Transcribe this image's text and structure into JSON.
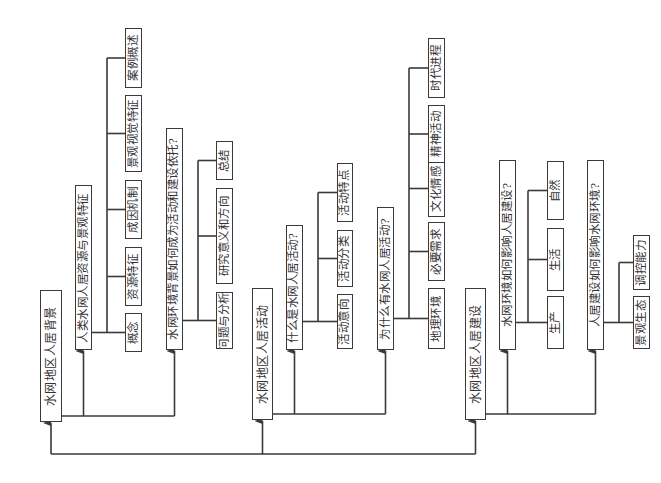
{
  "diagram": {
    "type": "hierarchical-tree",
    "orientation": "rotated-90-ccw",
    "line_color": "#3a3a3a",
    "sections": [
      {
        "id": "s1",
        "root": {
          "label": "水网地区人居背景",
          "box": [
            40,
            290,
            22,
            132
          ]
        },
        "branches": [
          {
            "label": "人类水网人居资源与景观特征",
            "box": [
              75,
              185,
              17,
              165
            ],
            "bracket_x": 107,
            "children": [
              {
                "label": "概念",
                "box": [
                  125,
                  313,
                  17,
                  39
                ]
              },
              {
                "label": "资源特征",
                "box": [
                  125,
                  247,
                  17,
                  59
                ]
              },
              {
                "label": "成因机制",
                "box": [
                  125,
                  180,
                  17,
                  59
                ]
              },
              {
                "label": "景观视觉特征",
                "box": [
                  125,
                  95,
                  17,
                  77
                ]
              },
              {
                "label": "案例概述",
                "box": [
                  125,
                  28,
                  17,
                  60
                ]
              }
            ]
          },
          {
            "label": "水网环境背景如何成为活动和建设依托?",
            "box": [
              166,
              128,
              17,
              222
            ],
            "bracket_x": 198,
            "children": [
              {
                "label": "问题与分析",
                "box": [
                  216,
                  292,
                  17,
                  57
                ]
              },
              {
                "label": "研究意义和方向",
                "box": [
                  216,
                  188,
                  17,
                  96
                ]
              },
              {
                "label": "总结",
                "box": [
                  216,
                  141,
                  17,
                  39
                ]
              }
            ]
          }
        ]
      },
      {
        "id": "s2",
        "root": {
          "label": "水网地区人居活动",
          "box": [
            252,
            288,
            21,
            132
          ]
        },
        "branches": [
          {
            "label": "什么是水网人居活动?",
            "box": [
              286,
              225,
              17,
              125
            ],
            "bracket_x": 318,
            "children": [
              {
                "label": "活动意向",
                "box": [
                  337,
                  294,
                  16,
                  55
                ]
              },
              {
                "label": "活动分类",
                "box": [
                  337,
                  230,
                  16,
                  57
                ]
              },
              {
                "label": "活动特点",
                "box": [
                  337,
                  163,
                  16,
                  59
                ]
              }
            ]
          },
          {
            "label": "为什么有水网人居活动?",
            "box": [
              377,
              207,
              17,
              143
            ],
            "bracket_x": 409,
            "children": [
              {
                "label": "地理环境",
                "box": [
                  428,
                  288,
                  17,
                  61
                ]
              },
              {
                "label": "必要需求",
                "box": [
                  428,
                  222,
                  17,
                  59
                ]
              },
              {
                "label": "文化情感",
                "box": [
                  428,
                  160,
                  17,
                  57
                ]
              },
              {
                "label": "精神活动",
                "box": [
                  428,
                  105,
                  17,
                  58
                ]
              },
              {
                "label": "时代进程",
                "box": [
                  428,
                  38,
                  17,
                  60
                ]
              }
            ]
          }
        ]
      },
      {
        "id": "s3",
        "root": {
          "label": "水网地区人居建设",
          "box": [
            465,
            288,
            21,
            132
          ]
        },
        "branches": [
          {
            "label": "水网环境如何影响人居建设?",
            "box": [
              499,
              160,
              17,
              190
            ],
            "bracket_x": 528,
            "children": [
              {
                "label": "生产",
                "box": [
                  547,
                  296,
                  17,
                  53
                ]
              },
              {
                "label": "生活",
                "box": [
                  547,
                  228,
                  17,
                  63
                ]
              },
              {
                "label": "自然",
                "box": [
                  547,
                  161,
                  17,
                  59
                ]
              }
            ]
          },
          {
            "label": "人居建设如何影响水网环境?",
            "box": [
              587,
              160,
              17,
              190
            ],
            "bracket_x": 619,
            "children": [
              {
                "label": "景观生态",
                "box": [
                  633,
                  296,
                  17,
                  53
                ]
              },
              {
                "label": "调控能力",
                "box": [
                  633,
                  235,
                  17,
                  55
                ]
              }
            ]
          }
        ]
      }
    ],
    "bottom_bus_y": 454
  }
}
